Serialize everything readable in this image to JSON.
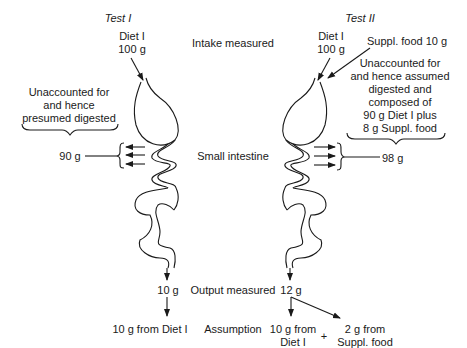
{
  "test1": {
    "title": "Test I",
    "input_label": "Diet I",
    "input_amount": "100 g",
    "unaccounted_lines": [
      "Unaccounted for",
      "and hence",
      "presumed digested"
    ],
    "digested_amount": "90 g",
    "output_amount": "10 g",
    "assumption": "10 g from Diet I"
  },
  "test2": {
    "title": "Test II",
    "input_label": "Diet I",
    "input_amount": "100 g",
    "suppl_input": "Suppl. food 10 g",
    "unaccounted_lines": [
      "Unaccounted for",
      "and hence assumed",
      "digested and",
      "composed of",
      "90 g Diet I plus",
      "8 g Suppl. food"
    ],
    "digested_amount": "98 g",
    "output_amount": "12 g",
    "assumption_a_lines": [
      "10 g from",
      "Diet I"
    ],
    "plus": "+",
    "assumption_b_lines": [
      "2 g from",
      "Suppl. food"
    ]
  },
  "stages": {
    "intake": "Intake measured",
    "small_intestine": "Small intestine",
    "output": "Output measured",
    "assumption": "Assumption"
  }
}
